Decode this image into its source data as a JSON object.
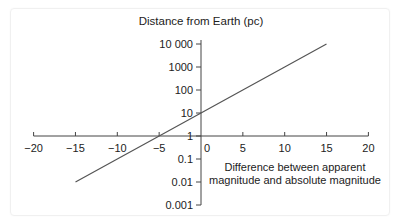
{
  "chart_data": {
    "type": "line",
    "title": "",
    "ylabel": "Distance from Earth (pc)",
    "xlabel_lines": [
      "Difference between apparent",
      "magnitude and absolute magnitude"
    ],
    "xlabel": "Difference between apparent magnitude and absolute magnitude",
    "x_ticks": [
      -20,
      -15,
      -10,
      -5,
      0,
      5,
      10,
      15,
      20
    ],
    "x_tick_labels": [
      "−20",
      "−15",
      "−10",
      "−5",
      "0",
      "5",
      "10",
      "15",
      "20"
    ],
    "y_scale": "log",
    "y_ticks": [
      0.001,
      0.01,
      0.1,
      1,
      10,
      100,
      1000,
      10000
    ],
    "y_tick_labels": [
      "0.001",
      "0.01",
      "0.1",
      "1",
      "10",
      "100",
      "1000",
      "10 000"
    ],
    "xlim": [
      -20,
      20
    ],
    "ylim": [
      0.001,
      10000
    ],
    "grid": false,
    "legend": null,
    "series": [
      {
        "name": "distance = 10^((m−M+5)/5)",
        "x": [
          -15,
          -10,
          -5,
          0,
          5,
          10,
          15
        ],
        "values": [
          0.01,
          0.1,
          1,
          10,
          100,
          1000,
          10000
        ]
      }
    ],
    "line_color": "#555555"
  }
}
